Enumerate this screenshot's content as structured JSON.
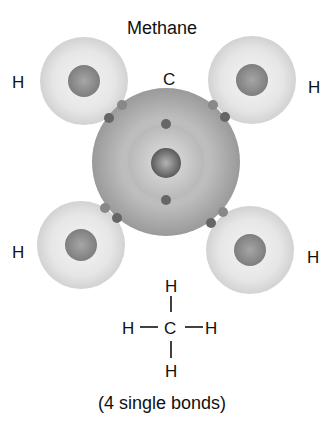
{
  "title": "Methane",
  "atoms": {
    "carbon_label": "C",
    "h_top_left": "H",
    "h_top_right": "H",
    "h_bottom_left": "H",
    "h_bottom_right": "H"
  },
  "structural_formula": {
    "top": "H",
    "left": "H",
    "center": "C",
    "right": "H",
    "bottom": "H",
    "bond": "—"
  },
  "caption": "(4 single bonds)"
}
